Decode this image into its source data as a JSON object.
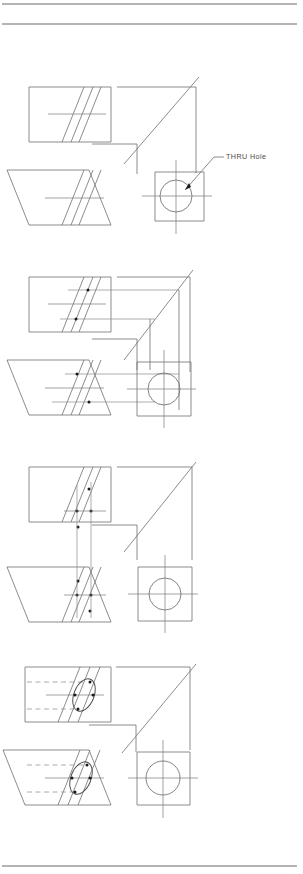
{
  "page": {
    "width": 303,
    "height": 874,
    "background_color": "#ffffff",
    "line_color": "#6e6e6e",
    "accent_color": "#1a1a1a"
  },
  "rules": {
    "top_rule_1_y": 4,
    "top_rule_2_y": 24,
    "bottom_rule_y": 866,
    "rule_color": "#6a6a6a",
    "left_x": 2,
    "right_x": 297
  },
  "annotations": {
    "thru_hole_label": "THRU Hole"
  },
  "steps": [
    {
      "index": 1,
      "name": "step-1-base-views",
      "description": "Base orthographic views with oblique band and THRU hole circle",
      "origin_y": 60,
      "has_projection_lines": false,
      "has_points": false,
      "has_ellipse": false,
      "has_hidden_lines": false,
      "has_label": true
    },
    {
      "index": 2,
      "name": "step-2-horizontal-projection",
      "description": "Horizontal projection lines transferred from circle to front view",
      "origin_y": 250,
      "has_projection_lines": true,
      "has_points": true,
      "has_ellipse": false,
      "has_hidden_lines": false,
      "has_label": false
    },
    {
      "index": 3,
      "name": "step-3-vertical-projection",
      "description": "Vertical projection lines transferred between top and front views",
      "origin_y": 440,
      "has_projection_lines": true,
      "has_points": true,
      "has_ellipse": false,
      "has_hidden_lines": false,
      "has_label": false
    },
    {
      "index": 4,
      "name": "step-4-completed-ellipse",
      "description": "Completed ellipse on the inclined surface with hidden lines",
      "origin_y": 640,
      "has_projection_lines": false,
      "has_points": true,
      "has_ellipse": true,
      "has_hidden_lines": true,
      "has_label": false
    }
  ],
  "geometry": {
    "front_view": {
      "name": "front-view-rectangle",
      "x": 29,
      "y": 27,
      "width": 82,
      "height": 55,
      "band_top_left_x": 62,
      "band_top_right_x": 79,
      "band_skew": 22
    },
    "top_view": {
      "name": "top-view-parallelogram",
      "x": 29,
      "y": 110,
      "width": 82,
      "height": 55
    },
    "side_view": {
      "name": "side-view-square",
      "x": 155,
      "y": 112,
      "size": 49,
      "circle_center_x": 176,
      "circle_center_y": 136,
      "circle_radius": 16
    },
    "miter": {
      "name": "miter-line-45deg",
      "x1": 124,
      "y1": 104,
      "x2": 198,
      "y2": 17
    }
  }
}
